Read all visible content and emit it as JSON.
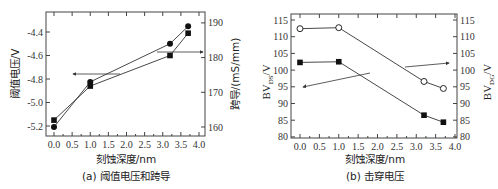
{
  "chart_data": [
    {
      "type": "line",
      "caption": "(a) 阈值电压和跨导",
      "xlabel": "刻蚀深度/nm",
      "ylabel_left": "阈值电压/V",
      "ylabel_right": "跨导/(mS/mm)",
      "x": [
        0.0,
        1.0,
        3.2,
        3.7
      ],
      "xticks": [
        "0.0",
        "0.5",
        "1.0",
        "1.5",
        "2.0",
        "2.5",
        "3.0",
        "3.5",
        "4.0"
      ],
      "xlim": [
        -0.2,
        4.2
      ],
      "yticks_left": [
        "-4.4",
        "-4.6",
        "-4.8",
        "-5.0",
        "-5.2"
      ],
      "ylim_left": [
        -5.3,
        -4.22
      ],
      "yticks_right": [
        "190",
        "180",
        "170",
        "160"
      ],
      "ylim_right": [
        157,
        191
      ],
      "grid": false,
      "series": [
        {
          "name": "阈值电压",
          "axis": "left",
          "marker": "square-filled",
          "values": [
            -5.15,
            -4.86,
            -4.6,
            -4.41
          ]
        },
        {
          "name": "跨导",
          "axis": "right",
          "marker": "circle-filled",
          "values": [
            160,
            173,
            184,
            189
          ]
        }
      ],
      "annotations": [
        {
          "type": "arrow",
          "direction": "left",
          "refers_to": "阈值电压"
        },
        {
          "type": "arrow",
          "direction": "right",
          "refers_to": "跨导"
        }
      ]
    },
    {
      "type": "line",
      "caption": "(b) 击穿电压",
      "xlabel": "刻蚀深度/nm",
      "ylabel_left": "BV_DS/V",
      "ylabel_right": "BV_DG/V",
      "x": [
        0.0,
        1.0,
        3.2,
        3.7
      ],
      "xticks": [
        "0.0",
        "0.5",
        "1.0",
        "1.5",
        "2.0",
        "2.5",
        "3.0",
        "3.5",
        "4.0"
      ],
      "xlim": [
        -0.2,
        4.0
      ],
      "yticks_left": [
        "115",
        "110",
        "105",
        "100",
        "95",
        "90",
        "85",
        "80"
      ],
      "ylim_left": [
        80,
        117
      ],
      "yticks_right": [
        "115",
        "110",
        "105",
        "100",
        "95",
        "90",
        "85",
        "80"
      ],
      "ylim_right": [
        80,
        117
      ],
      "grid": false,
      "series": [
        {
          "name": "BV_DS",
          "axis": "left",
          "marker": "square-filled",
          "values": [
            102.3,
            102.5,
            86.5,
            84.4
          ]
        },
        {
          "name": "BV_DG",
          "axis": "right",
          "marker": "circle-open",
          "values": [
            112.4,
            112.7,
            96.6,
            94.5
          ]
        }
      ],
      "annotations": [
        {
          "type": "arrow",
          "direction": "left",
          "refers_to": "BV_DS"
        },
        {
          "type": "arrow",
          "direction": "right",
          "refers_to": "BV_DG"
        }
      ]
    }
  ],
  "panels": {
    "a": {
      "caption": "(a) 阈值电压和跨导",
      "xlabel": "刻蚀深度/nm",
      "ylabel_left": "阈值电压/V",
      "ylabel_right": "跨导/(mS/mm)"
    },
    "b": {
      "caption": "(b) 击穿电压",
      "xlabel": "刻蚀深度/nm",
      "ylabel_left_main": "BV",
      "ylabel_left_sub": "DS",
      "ylabel_left_unit": "/V",
      "ylabel_right_main": "BV",
      "ylabel_right_sub": "DG",
      "ylabel_right_unit": "/V"
    }
  },
  "colors": {
    "line": "#333333",
    "marker": "#111111",
    "axis": "#444444"
  }
}
